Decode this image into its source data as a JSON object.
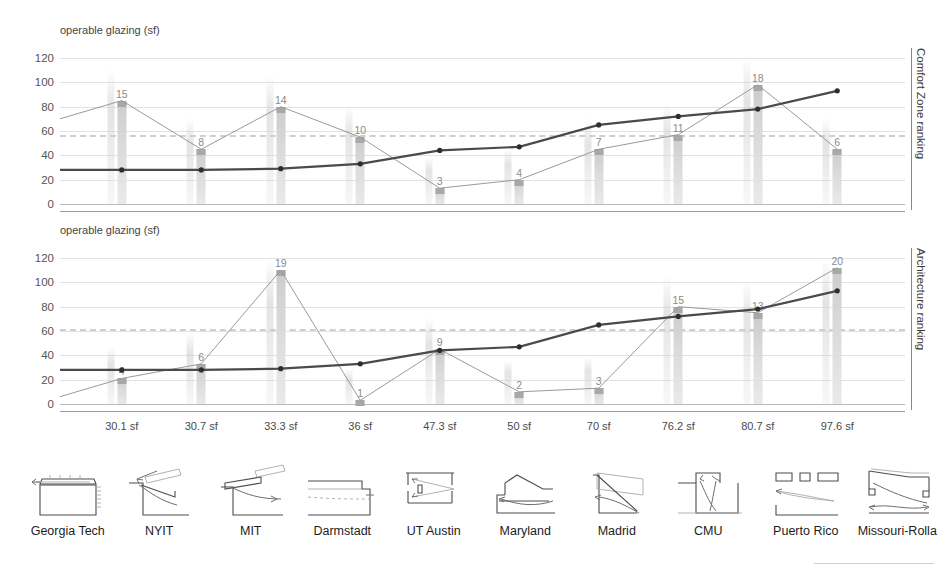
{
  "chart_data": [
    {
      "type": "bar",
      "title": "operable glazing (sf)",
      "ylabel_right": "Comfort Zone ranking",
      "xlabel": "",
      "ylim": [
        0,
        120
      ],
      "yticks": [
        0,
        20,
        40,
        60,
        80,
        100,
        120
      ],
      "grid": true,
      "reference_line": 57,
      "categories": [
        "30.1 sf",
        "30.7 sf",
        "33.3 sf",
        "36 sf",
        "47.3 sf",
        "50 sf",
        "70 sf",
        "76.2 sf",
        "80.7 sf",
        "97.6 sf"
      ],
      "schools": [
        "Georgia Tech",
        "NYIT",
        "MIT",
        "Darmstadt",
        "UT Austin",
        "Maryland",
        "Madrid",
        "CMU",
        "Puerto Rico",
        "Missouri-Rolla"
      ],
      "series": [
        {
          "name": "Comfort Zone ranking",
          "style": "bar+thin-line",
          "values": [
            85,
            45,
            80,
            55,
            13,
            20,
            45,
            57,
            98,
            45
          ],
          "labels": [
            "15",
            "8",
            "14",
            "10",
            "3",
            "4",
            "7",
            "11",
            "18",
            "6"
          ]
        },
        {
          "name": "operable glazing (sf)",
          "style": "thick-line",
          "values": [
            28,
            28,
            29,
            33,
            44,
            47,
            65,
            72,
            78,
            93
          ]
        }
      ]
    },
    {
      "type": "bar",
      "title": "operable glazing (sf)",
      "ylabel_right": "Architecture ranking",
      "xlabel": "",
      "ylim": [
        0,
        120
      ],
      "yticks": [
        0,
        20,
        40,
        60,
        80,
        100,
        120
      ],
      "grid": true,
      "reference_line": 62,
      "categories": [
        "30.1 sf",
        "30.7 sf",
        "33.3 sf",
        "36 sf",
        "47.3 sf",
        "50 sf",
        "70 sf",
        "76.2 sf",
        "80.7 sf",
        "97.6 sf"
      ],
      "schools": [
        "Georgia Tech",
        "NYIT",
        "MIT",
        "Darmstadt",
        "UT Austin",
        "Maryland",
        "Madrid",
        "CMU",
        "Puerto Rico",
        "Missouri-Rolla"
      ],
      "series": [
        {
          "name": "Architecture ranking",
          "style": "bar+thin-line",
          "values": [
            21,
            33,
            110,
            3,
            45,
            10,
            13,
            80,
            75,
            112
          ],
          "labels": [
            "4",
            "6",
            "19",
            "1",
            "9",
            "2",
            "3",
            "15",
            "13",
            "20"
          ]
        },
        {
          "name": "operable glazing (sf)",
          "style": "thick-line",
          "values": [
            28,
            28,
            29,
            33,
            44,
            47,
            65,
            72,
            78,
            93
          ]
        }
      ]
    }
  ],
  "top_chart": {
    "axis_title": "operable glazing (sf)",
    "vertical_label": "Comfort Zone ranking"
  },
  "bottom_chart": {
    "axis_title": "operable glazing (sf)",
    "vertical_label": "Architecture ranking"
  },
  "thumbnails": [
    {
      "name": "georgia-tech-section"
    },
    {
      "name": "nyit-section"
    },
    {
      "name": "mit-section"
    },
    {
      "name": "darmstadt-section"
    },
    {
      "name": "ut-austin-section"
    },
    {
      "name": "maryland-section"
    },
    {
      "name": "madrid-section"
    },
    {
      "name": "cmu-section"
    },
    {
      "name": "puerto-rico-section"
    },
    {
      "name": "missouri-rolla-section"
    }
  ]
}
